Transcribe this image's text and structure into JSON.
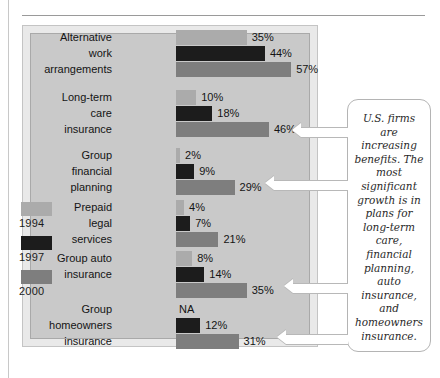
{
  "chart_data": {
    "type": "bar",
    "orientation": "horizontal",
    "title": "",
    "xlabel": "",
    "ylabel": "",
    "xlim": [
      0,
      60
    ],
    "grid": false,
    "legend_position": "left",
    "units": "%",
    "categories": [
      "Alternative work arrangements",
      "Long-term care insurance",
      "Group financial planning",
      "Prepaid legal services",
      "Group auto insurance",
      "Group homeowners insurance"
    ],
    "series": [
      {
        "name": "1994",
        "color": "#ababab",
        "values": [
          35,
          10,
          2,
          4,
          8,
          null
        ]
      },
      {
        "name": "1997",
        "color": "#1c1c1c",
        "values": [
          44,
          18,
          9,
          7,
          14,
          12
        ]
      },
      {
        "name": "2000",
        "color": "#7e7e7e",
        "values": [
          57,
          46,
          29,
          21,
          35,
          31
        ]
      }
    ],
    "annotations": [
      "U.S. firms are increasing benefits. The most significant growth is in plans for long-term care, financial planning, auto insurance, and homeowners insurance."
    ]
  },
  "legend": {
    "entries": [
      {
        "label": "1994",
        "color": "#ababab"
      },
      {
        "label": "1997",
        "color": "#1c1c1c"
      },
      {
        "label": "2000",
        "color": "#7e7e7e"
      }
    ]
  },
  "groups": [
    {
      "id": "alternative-work-arrangements",
      "label_lines": [
        "Alternative",
        "work",
        "arrangements"
      ],
      "rows": [
        {
          "series": "1994",
          "label": "Alternative",
          "value": 35,
          "value_text": "35%",
          "color": "#ababab",
          "na": false
        },
        {
          "series": "1997",
          "label": "work",
          "value": 44,
          "value_text": "44%",
          "color": "#1c1c1c",
          "na": false
        },
        {
          "series": "2000",
          "label": "arrangements",
          "value": 57,
          "value_text": "57%",
          "color": "#7e7e7e",
          "na": false
        }
      ]
    },
    {
      "id": "long-term-care-insurance",
      "label_lines": [
        "Long-term",
        "care",
        "insurance"
      ],
      "rows": [
        {
          "series": "1994",
          "label": "Long-term",
          "value": 10,
          "value_text": "10%",
          "color": "#ababab",
          "na": false
        },
        {
          "series": "1997",
          "label": "care",
          "value": 18,
          "value_text": "18%",
          "color": "#1c1c1c",
          "na": false
        },
        {
          "series": "2000",
          "label": "insurance",
          "value": 46,
          "value_text": "46%",
          "color": "#7e7e7e",
          "na": false
        }
      ]
    },
    {
      "id": "group-financial-planning",
      "label_lines": [
        "Group",
        "financial",
        "planning"
      ],
      "rows": [
        {
          "series": "1994",
          "label": "Group",
          "value": 2,
          "value_text": "2%",
          "color": "#ababab",
          "na": false
        },
        {
          "series": "1997",
          "label": "financial",
          "value": 9,
          "value_text": "9%",
          "color": "#1c1c1c",
          "na": false
        },
        {
          "series": "2000",
          "label": "planning",
          "value": 29,
          "value_text": "29%",
          "color": "#7e7e7e",
          "na": false
        }
      ]
    },
    {
      "id": "prepaid-legal-services",
      "label_lines": [
        "Prepaid",
        "legal",
        "services"
      ],
      "rows": [
        {
          "series": "1994",
          "label": "Prepaid",
          "value": 4,
          "value_text": "4%",
          "color": "#ababab",
          "na": false
        },
        {
          "series": "1997",
          "label": "legal",
          "value": 7,
          "value_text": "7%",
          "color": "#1c1c1c",
          "na": false
        },
        {
          "series": "2000",
          "label": "services",
          "value": 21,
          "value_text": "21%",
          "color": "#7e7e7e",
          "na": false
        }
      ]
    },
    {
      "id": "group-auto-insurance",
      "label_lines": [
        "Group auto",
        "insurance"
      ],
      "rows": [
        {
          "series": "1994",
          "label": "Group auto",
          "value": 8,
          "value_text": "8%",
          "color": "#ababab",
          "na": false
        },
        {
          "series": "1997",
          "label": "insurance",
          "value": 14,
          "value_text": "14%",
          "color": "#1c1c1c",
          "na": false
        },
        {
          "series": "2000",
          "label": "",
          "value": 35,
          "value_text": "35%",
          "color": "#7e7e7e",
          "na": false
        }
      ]
    },
    {
      "id": "group-homeowners-insurance",
      "label_lines": [
        "Group",
        "homeowners",
        "insurance"
      ],
      "rows": [
        {
          "series": "1994",
          "label": "Group",
          "value": 0,
          "value_text": "NA",
          "color": "#ababab",
          "na": true
        },
        {
          "series": "1997",
          "label": "homeowners",
          "value": 12,
          "value_text": "12%",
          "color": "#1c1c1c",
          "na": false
        },
        {
          "series": "2000",
          "label": "insurance",
          "value": 31,
          "value_text": "31%",
          "color": "#7e7e7e",
          "na": false
        }
      ]
    }
  ],
  "callout": {
    "text": "U.S. firms are increasing benefits. The most significant growth is in plans for long-term care, financial planning, auto insurance, and homeowners insurance."
  }
}
